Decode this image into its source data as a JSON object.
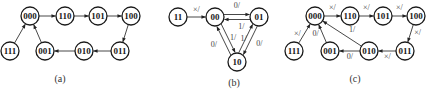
{
  "diagrams": [
    {
      "id": "a",
      "caption": "(a)",
      "nodes": [
        {
          "id": "000",
          "label": "000"
        },
        {
          "id": "110",
          "label": "110"
        },
        {
          "id": "101",
          "label": "101"
        },
        {
          "id": "100",
          "label": "100"
        },
        {
          "id": "111",
          "label": "111"
        },
        {
          "id": "001",
          "label": "001"
        },
        {
          "id": "010",
          "label": "010"
        },
        {
          "id": "011",
          "label": "011"
        }
      ],
      "edges": [
        {
          "from": "000",
          "to": "110",
          "label": ""
        },
        {
          "from": "110",
          "to": "101",
          "label": ""
        },
        {
          "from": "101",
          "to": "100",
          "label": ""
        },
        {
          "from": "100",
          "to": "011",
          "label": ""
        },
        {
          "from": "011",
          "to": "010",
          "label": ""
        },
        {
          "from": "010",
          "to": "001",
          "label": ""
        },
        {
          "from": "001",
          "to": "000",
          "label": ""
        },
        {
          "from": "111",
          "to": "000",
          "label": ""
        }
      ]
    },
    {
      "id": "b",
      "caption": "(b)",
      "nodes": [
        {
          "id": "11",
          "label": "11"
        },
        {
          "id": "00",
          "label": "00"
        },
        {
          "id": "01",
          "label": "01"
        },
        {
          "id": "10",
          "label": "10"
        }
      ],
      "edges": [
        {
          "from": "11",
          "to": "00",
          "label": "×/"
        },
        {
          "from": "00",
          "to": "01",
          "label": "0/"
        },
        {
          "from": "01",
          "to": "00",
          "label": "1/"
        },
        {
          "from": "00",
          "to": "10",
          "label": "1/"
        },
        {
          "from": "10",
          "to": "00",
          "label": "0/"
        },
        {
          "from": "10",
          "to": "01",
          "label": "1/"
        },
        {
          "from": "01",
          "to": "10",
          "label": "0/"
        }
      ]
    },
    {
      "id": "c",
      "caption": "(c)",
      "nodes": [
        {
          "id": "000",
          "label": "000"
        },
        {
          "id": "110",
          "label": "110"
        },
        {
          "id": "101",
          "label": "101"
        },
        {
          "id": "100",
          "label": "100"
        },
        {
          "id": "111",
          "label": "111"
        },
        {
          "id": "001",
          "label": "001"
        },
        {
          "id": "010",
          "label": "010"
        },
        {
          "id": "011",
          "label": "011"
        }
      ],
      "edges": [
        {
          "from": "000",
          "to": "110",
          "label": "×/"
        },
        {
          "from": "110",
          "to": "101",
          "label": "×/"
        },
        {
          "from": "101",
          "to": "100",
          "label": "×/"
        },
        {
          "from": "100",
          "to": "011",
          "label": "×/"
        },
        {
          "from": "011",
          "to": "010",
          "label": "×/"
        },
        {
          "from": "010",
          "to": "001",
          "label": "0/"
        },
        {
          "from": "010",
          "to": "000",
          "label": "1/"
        },
        {
          "from": "001",
          "to": "000",
          "label": "0/"
        },
        {
          "from": "111",
          "to": "000",
          "label": "×/"
        }
      ]
    }
  ]
}
